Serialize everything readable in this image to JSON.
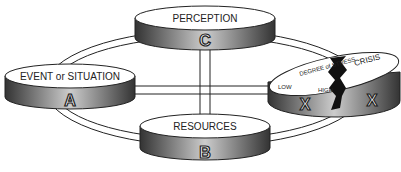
{
  "nodes": {
    "a": {
      "label": "EVENT or SITUATION",
      "letter": "A"
    },
    "b": {
      "label": "RESOURCES",
      "letter": "B"
    },
    "c": {
      "label": "PERCEPTION",
      "letter": "C"
    },
    "x": {
      "label_stress": "DEGREE of STRESS",
      "low": "LOW",
      "high": "HIGH",
      "crisis": "CRISIS",
      "letter_left": "X",
      "letter_right": "X"
    }
  }
}
